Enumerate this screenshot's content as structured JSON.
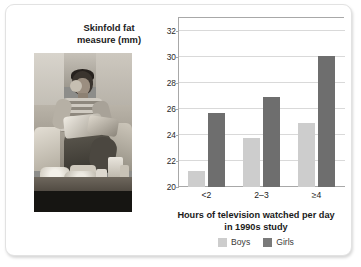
{
  "figure": {
    "photo": {
      "credit": "Tony Freeman/PhotoEdit",
      "alt_name": "boy-eating-snacks-on-couch-photo"
    }
  },
  "chart_data": {
    "type": "bar",
    "title": "Skinfold fat measure (mm)",
    "xlabel": "Hours of television watched per day",
    "xlabel_line2": "in 1990s study",
    "ylabel": "Skinfold fat measure (mm)",
    "categories": [
      "<2",
      "2–3",
      "≥4"
    ],
    "series": [
      {
        "name": "Boys",
        "color": "#cdcdcd",
        "values": [
          21.2,
          23.8,
          24.9
        ]
      },
      {
        "name": "Girls",
        "color": "#6e6e6e",
        "values": [
          25.7,
          26.9,
          30.1
        ]
      }
    ],
    "ylim": [
      20,
      33
    ],
    "yticks": [
      20,
      22,
      24,
      26,
      28,
      30,
      32
    ],
    "ytick_labels": [
      "20",
      "22",
      "24",
      "26",
      "28",
      "30",
      "32"
    ],
    "grid": true,
    "legend_position": "bottom",
    "legend": [
      "Boys",
      "Girls"
    ]
  }
}
